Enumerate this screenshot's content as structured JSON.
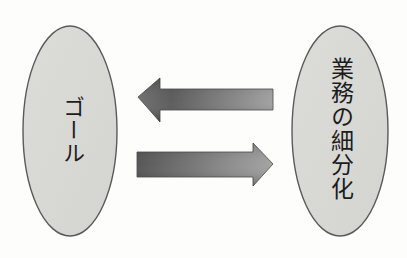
{
  "diagram": {
    "left_node": {
      "label": "ゴール"
    },
    "right_node": {
      "label": "業務の細分化"
    },
    "arrows": [
      {
        "direction": "left",
        "from": "業務の細分化",
        "to": "ゴール"
      },
      {
        "direction": "right",
        "from": "ゴール",
        "to": "業務の細分化"
      }
    ],
    "colors": {
      "background": "#fdfdfb",
      "node_fill": "#dadad7",
      "node_stroke": "#5a5a5a",
      "arrow_dark": "#4a4a4a",
      "arrow_light": "#a8a8a8",
      "text": "#1c1c1c"
    }
  }
}
